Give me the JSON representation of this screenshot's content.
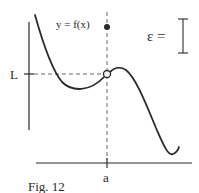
{
  "figure": {
    "caption": "Fig. 12",
    "function_label": "y = f(x)",
    "limit_label": "L",
    "point_label": "a",
    "epsilon_label": "ε =",
    "colors": {
      "ink": "#2a2a2a",
      "dashed": "#6a6a6a",
      "background": "#ffffff"
    },
    "elements": {
      "open_circle": "hole at (a, L)",
      "filled_dot": "f(a) plotted above L",
      "epsilon_bracket": "vertical I-beam bracket indicating epsilon length"
    }
  }
}
